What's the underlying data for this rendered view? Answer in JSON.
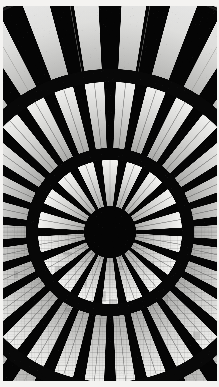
{
  "image": {
    "title": "Radial glass dome seen from below",
    "subject": "circular skylight rosette",
    "medium": "black and white photograph",
    "orientation": "portrait",
    "width": 219,
    "height": 387
  },
  "frame": {
    "border_color": "#f4f3f1",
    "border_top": 6,
    "border_left": 3,
    "border_right": 2,
    "border_bottom": 6
  },
  "palette": {
    "black": "#050505",
    "near_black": "#0b0b0b",
    "dark_gray": "#1a1a1a",
    "mid_gray": "#7d7d7d",
    "light_gray": "#c9c9c9",
    "pane_white": "#f2f2f0",
    "highlight": "#ffffff",
    "sky": "#e8e8e6"
  },
  "chart_data": {
    "type": "pie",
    "title": "Radial glass dome seen from below",
    "xlabel": "",
    "ylabel": "",
    "center_x": 110,
    "center_y": 232,
    "rings": [
      {
        "name": "hub",
        "inner_radius": 0,
        "outer_radius": 26,
        "segments": 1,
        "fill": "#050505",
        "note": "solid dark central hub"
      },
      {
        "name": "inner-ring",
        "inner_radius": 26,
        "outer_radius": 72,
        "segments": 18,
        "wedge_fill": "#d8d8d6",
        "gap_fill": "#050505",
        "wedge_span_deg": 13,
        "rotation_deg": 0,
        "note": "tapered glass panes radiating from hub"
      },
      {
        "name": "mid-band",
        "inner_radius": 72,
        "outer_radius": 84,
        "segments": 1,
        "fill": "#070707",
        "note": "dark structural ring beam"
      },
      {
        "name": "outer-ring",
        "inner_radius": 84,
        "outer_radius": 150,
        "segments": 30,
        "wedge_fill": "#dcdcda",
        "gap_fill": "#050505",
        "wedge_span_deg": 7.5,
        "rotation_deg": 6,
        "note": "second band of narrow glass panes"
      },
      {
        "name": "rim-band",
        "inner_radius": 150,
        "outer_radius": 163,
        "segments": 1,
        "fill": "#080808",
        "note": "outer dark circumferential beam"
      },
      {
        "name": "perimeter-ring",
        "inner_radius": 163,
        "outer_radius": 250,
        "segments": 30,
        "wedge_fill": "#f0f0ee",
        "gap_fill": "#050505",
        "wedge_span_deg": 6.2,
        "rotation_deg": 6,
        "note": "largest outermost triangular panes opening to bright sky"
      }
    ],
    "arc_rim": {
      "name": "top-arc-beam",
      "radius": 252,
      "thickness": 7,
      "color": "#e9e9e7",
      "note": "bright curved rim of the dome visible across the top"
    },
    "spokes": {
      "count": 18,
      "color": "#9a9a98",
      "width": 0.7,
      "note": "thin tension cables over bright panes"
    },
    "legend": [],
    "annotations": []
  },
  "regions": [
    {
      "label": "center-hub",
      "x": 110,
      "y": 232
    },
    {
      "label": "inner-rosette",
      "x": 110,
      "y": 232
    },
    {
      "label": "outer-rosette",
      "x": 110,
      "y": 232
    },
    {
      "label": "top-rim-arc",
      "x": 110,
      "y": 20
    }
  ]
}
